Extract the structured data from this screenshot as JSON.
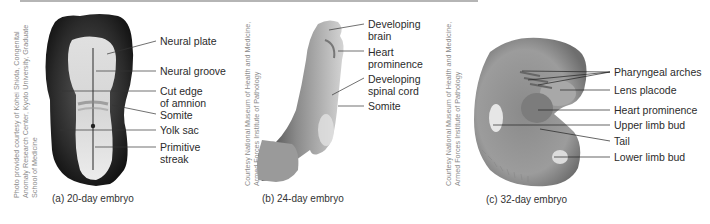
{
  "figure": {
    "panels": [
      {
        "id": "a",
        "caption": "(a) 20-day embryo",
        "credit": [
          "Photo provided courtesy of Kohei Shiota, Congenital",
          "Anomaly Research Center, Kyoto University, Graduate",
          "School of Medicine"
        ],
        "labels": [
          "Neural plate",
          "Neural groove",
          "Cut edge",
          "of amnion",
          "Somite",
          "Yolk sac",
          "Primitive",
          "streak"
        ]
      },
      {
        "id": "b",
        "caption": "(b) 24-day embryo",
        "credit": [
          "Courtesy National Museum of Health and Medicine,",
          "Armed Forces Institute of Pathology"
        ],
        "labels": [
          "Developing",
          "brain",
          "Heart",
          "prominence",
          "Developing",
          "spinal cord",
          "Somite"
        ]
      },
      {
        "id": "c",
        "caption": "(c) 32-day embryo",
        "credit": [
          "Courtesy National Museum of Health and Medicine,",
          "Armed Forces Institute of Pathology"
        ],
        "labels": [
          "Pharyngeal arches",
          "Lens placode",
          "Heart prominence",
          "Upper limb bud",
          "Tail",
          "Lower limb bud"
        ]
      }
    ]
  }
}
